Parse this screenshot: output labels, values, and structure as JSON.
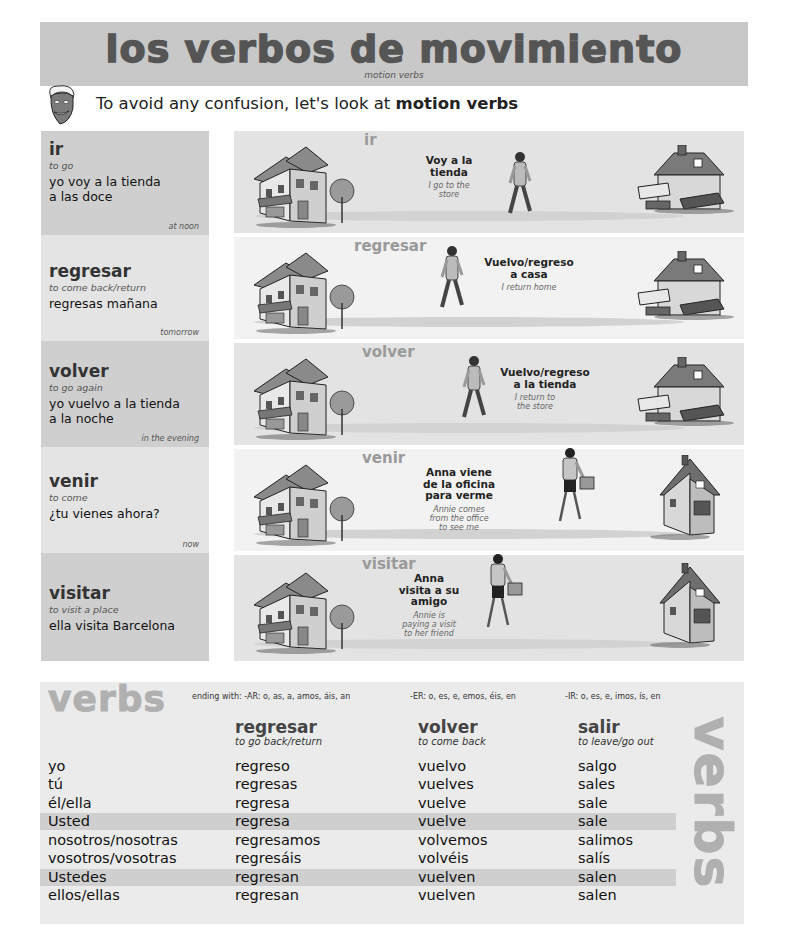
{
  "header": {
    "title": "los verbos de movimiento",
    "subtitle": "motion verbs",
    "intro_prefix": "To avoid any confusion, let's look at ",
    "intro_bold": "motion verbs",
    "mascot_icon": "cartoon-face-icon"
  },
  "verbs": [
    {
      "verb": "ir",
      "translation": "to go",
      "example_lines": [
        "yo voy a la tienda",
        "a las doce"
      ],
      "note": "at noon",
      "scene_label": "ir",
      "scene_spanish": [
        "Voy a la",
        "tienda"
      ],
      "scene_english": [
        "I go to the",
        "store"
      ]
    },
    {
      "verb": "regresar",
      "translation": "to come back/return",
      "example_lines": [
        "regresas mañana"
      ],
      "note": "tomorrow",
      "scene_label": "regresar",
      "scene_spanish": [
        "Vuelvo/regreso",
        "a casa"
      ],
      "scene_english": [
        "I return home"
      ]
    },
    {
      "verb": "volver",
      "translation": "to go again",
      "example_lines": [
        "yo vuelvo a la tienda",
        "a la noche"
      ],
      "note": "in the evening",
      "scene_label": "volver",
      "scene_spanish": [
        "Vuelvo/regreso",
        "a la tienda"
      ],
      "scene_english": [
        "I return to",
        "the store"
      ]
    },
    {
      "verb": "venir",
      "translation": "to come",
      "example_lines": [
        "¿tu vienes ahora?"
      ],
      "note": "now",
      "scene_label": "venir",
      "scene_spanish": [
        "Anna viene",
        "de la oficina",
        "para verme"
      ],
      "scene_english": [
        "Annie comes",
        "from the office",
        "to see me"
      ]
    },
    {
      "verb": "visitar",
      "translation": "to visit a place",
      "example_lines": [
        "ella visita Barcelona"
      ],
      "note": "",
      "scene_label": "visitar",
      "scene_spanish": [
        "Anna",
        "visita a su",
        "amigo"
      ],
      "scene_english": [
        "Annie is",
        "paying  a visit",
        "to her friend"
      ]
    }
  ],
  "table": {
    "title": "verbs",
    "side_title": "verbs",
    "endings": {
      "ar": "ending with: -AR: o, as, a, amos, áis, an",
      "er": "-ER: o, es, e, emos, éis, en",
      "ir": "-IR: o, es, e, imos, ís, en"
    },
    "columns": [
      {
        "verb": "regresar",
        "translation": "to go back/return"
      },
      {
        "verb": "volver",
        "translation": "to come back"
      },
      {
        "verb": "salir",
        "translation": "to leave/go out"
      }
    ],
    "rows": [
      {
        "pronoun": "yo",
        "forms": [
          "regreso",
          "vuelvo",
          "salgo"
        ],
        "highlight": false
      },
      {
        "pronoun": "tú",
        "forms": [
          "regresas",
          "vuelves",
          "sales"
        ],
        "highlight": false
      },
      {
        "pronoun": "él/ella",
        "forms": [
          "regresa",
          "vuelve",
          "sale"
        ],
        "highlight": false
      },
      {
        "pronoun": "Usted",
        "forms": [
          "regresa",
          "vuelve",
          "sale"
        ],
        "highlight": true
      },
      {
        "pronoun": "nosotros/nosotras",
        "forms": [
          "regresamos",
          "volvemos",
          "salimos"
        ],
        "highlight": false
      },
      {
        "pronoun": "vosotros/vosotras",
        "forms": [
          "regresáis",
          "volvéis",
          "salís"
        ],
        "highlight": false
      },
      {
        "pronoun": "Ustedes",
        "forms": [
          "regresan",
          "vuelven",
          "salen"
        ],
        "highlight": true
      },
      {
        "pronoun": "ellos/ellas",
        "forms": [
          "regresan",
          "vuelven",
          "salen"
        ],
        "highlight": false
      }
    ]
  },
  "colors": {
    "banner_bg": "#c8c8c8",
    "title_text": "#555555",
    "panel_dark": "#cfcfcf",
    "panel_light": "#e4e4e4",
    "watermark_gray": "#b0b0b0",
    "row_highlight": "#cfcfcf"
  }
}
